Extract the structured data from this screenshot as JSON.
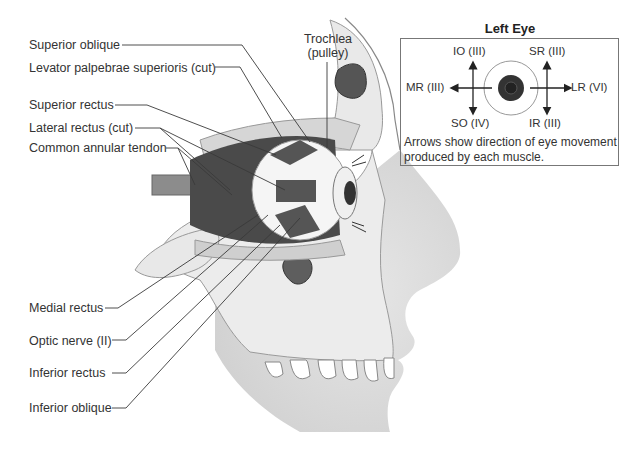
{
  "figure": {
    "left_labels": [
      {
        "id": "superior-oblique",
        "text": "Superior oblique"
      },
      {
        "id": "levator",
        "text": "Levator palpebrae superioris (cut)"
      },
      {
        "id": "superior-rectus",
        "text": "Superior rectus"
      },
      {
        "id": "lateral-rectus",
        "text": "Lateral rectus (cut)"
      },
      {
        "id": "annular-tendon",
        "text": "Common annular tendon"
      },
      {
        "id": "medial-rectus",
        "text": "Medial rectus"
      },
      {
        "id": "optic-nerve",
        "text": "Optic nerve (II)"
      },
      {
        "id": "inferior-rectus",
        "text": "Inferior rectus"
      },
      {
        "id": "inferior-oblique",
        "text": "Inferior oblique"
      }
    ],
    "trochlea": {
      "line1": "Trochlea",
      "line2": "(pulley)"
    }
  },
  "inset": {
    "title": "Left Eye",
    "labels": {
      "io": "IO (III)",
      "sr": "SR (III)",
      "mr": "MR (III)",
      "lr": "LR (VI)",
      "so": "SO (IV)",
      "ir": "IR (III)"
    },
    "caption": "Arrows show direction of eye movement produced by each muscle."
  }
}
